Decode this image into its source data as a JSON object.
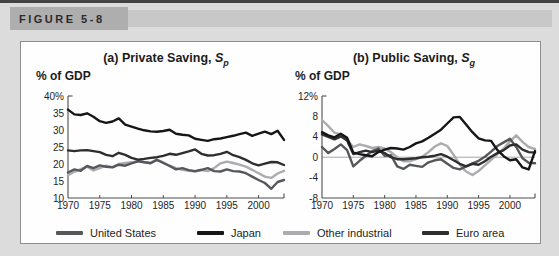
{
  "header": {
    "figure_label": "FIGURE 5-8"
  },
  "legend": {
    "items": [
      {
        "label": "United States",
        "color": "#55575a"
      },
      {
        "label": "Japan",
        "color": "#161616"
      },
      {
        "label": "Other industrial",
        "color": "#aaacaf"
      },
      {
        "label": "Euro area",
        "color": "#2e2e2e"
      }
    ]
  },
  "chart_data": [
    {
      "type": "line",
      "title_main": "(a) Private Saving,",
      "title_symbol": "S",
      "title_subscript": "p",
      "ylabel": "% of GDP",
      "xlim": [
        1970,
        2004
      ],
      "ylim": [
        10,
        40
      ],
      "x_ticks": [
        1970,
        1975,
        1980,
        1985,
        1990,
        1995,
        2000
      ],
      "x_tick_labels": [
        "1970",
        "1975",
        "1980",
        "1985",
        "1990",
        "1995",
        "2000"
      ],
      "y_ticks": [
        10,
        15,
        20,
        25,
        30,
        35,
        40
      ],
      "y_tick_labels": [
        "10",
        "15",
        "20",
        "25",
        "30",
        "35",
        "40%"
      ],
      "zero_line": false,
      "grid": false,
      "x": [
        1970,
        1971,
        1972,
        1973,
        1974,
        1975,
        1976,
        1977,
        1978,
        1979,
        1980,
        1981,
        1982,
        1983,
        1984,
        1985,
        1986,
        1987,
        1988,
        1989,
        1990,
        1991,
        1992,
        1993,
        1994,
        1995,
        1996,
        1997,
        1998,
        1999,
        2000,
        2001,
        2002,
        2003,
        2004
      ],
      "series": [
        {
          "name": "Other industrial",
          "color": "#aaacaf",
          "values": [
            16.7,
            17.7,
            18.5,
            19.2,
            18.1,
            18.8,
            19.5,
            19.1,
            20.0,
            20.3,
            20.5,
            20.9,
            20.6,
            20.4,
            21.3,
            20.5,
            19.5,
            18.8,
            18.3,
            18.0,
            17.8,
            18.2,
            17.9,
            18.8,
            20.2,
            20.7,
            20.3,
            19.8,
            19.2,
            18.3,
            17.3,
            16.3,
            15.9,
            17.2,
            18.0
          ]
        },
        {
          "name": "United States",
          "color": "#55575a",
          "values": [
            17.5,
            18.4,
            18.0,
            19.4,
            18.8,
            19.6,
            19.2,
            19.0,
            19.8,
            19.5,
            20.2,
            20.8,
            20.5,
            20.2,
            21.2,
            20.3,
            19.4,
            18.4,
            18.8,
            18.2,
            17.9,
            18.3,
            18.8,
            17.9,
            17.8,
            18.4,
            17.9,
            17.8,
            17.3,
            16.3,
            15.3,
            14.4,
            12.7,
            14.7,
            15.3
          ]
        },
        {
          "name": "Euro area",
          "color": "#2e2e2e",
          "values": [
            24.0,
            23.8,
            24.0,
            24.1,
            23.8,
            23.5,
            22.7,
            22.3,
            23.3,
            22.7,
            21.8,
            21.3,
            21.5,
            21.8,
            22.0,
            22.4,
            23.0,
            22.7,
            23.2,
            23.7,
            24.3,
            23.0,
            22.5,
            22.6,
            23.0,
            23.6,
            22.6,
            22.0,
            21.2,
            20.2,
            19.6,
            20.1,
            20.6,
            20.5,
            19.7
          ]
        },
        {
          "name": "Japan",
          "color": "#161616",
          "values": [
            36.0,
            34.6,
            34.4,
            34.9,
            33.9,
            32.6,
            32.1,
            32.5,
            33.4,
            31.6,
            31.0,
            30.4,
            29.9,
            29.6,
            29.5,
            29.7,
            30.1,
            28.9,
            28.6,
            28.4,
            27.4,
            27.1,
            26.8,
            27.3,
            27.5,
            27.9,
            28.3,
            28.8,
            29.2,
            28.3,
            28.9,
            29.5,
            28.8,
            29.8,
            27.1
          ]
        }
      ]
    },
    {
      "type": "line",
      "title_main": "(b) Public Saving,",
      "title_symbol": "S",
      "title_subscript": "g",
      "ylabel": "% of GDP",
      "xlim": [
        1970,
        2004
      ],
      "ylim": [
        -8,
        12
      ],
      "x_ticks": [
        1970,
        1975,
        1980,
        1985,
        1990,
        1995,
        2000
      ],
      "x_tick_labels": [
        "1970",
        "1975",
        "1980",
        "1985",
        "1990",
        "1995",
        "2000"
      ],
      "y_ticks": [
        -8,
        -4,
        0,
        4,
        8,
        12
      ],
      "y_tick_labels": [
        "-8",
        "-4",
        "0",
        "4",
        "8",
        "12%"
      ],
      "zero_line": true,
      "grid": false,
      "x": [
        1970,
        1971,
        1972,
        1973,
        1974,
        1975,
        1976,
        1977,
        1978,
        1979,
        1980,
        1981,
        1982,
        1983,
        1984,
        1985,
        1986,
        1987,
        1988,
        1989,
        1990,
        1991,
        1992,
        1993,
        1994,
        1995,
        1996,
        1997,
        1998,
        1999,
        2000,
        2001,
        2002,
        2003,
        2004
      ],
      "series": [
        {
          "name": "Other industrial",
          "color": "#aaacaf",
          "values": [
            7.3,
            6.1,
            4.8,
            4.5,
            3.4,
            2.0,
            2.5,
            2.2,
            1.8,
            2.0,
            1.7,
            1.0,
            0.0,
            -0.8,
            -0.8,
            -0.4,
            0.1,
            1.0,
            2.1,
            2.7,
            2.2,
            0.5,
            -1.5,
            -2.8,
            -3.5,
            -2.7,
            -1.6,
            -0.5,
            0.6,
            1.7,
            3.1,
            4.3,
            3.0,
            2.0,
            1.6
          ]
        },
        {
          "name": "United States",
          "color": "#55575a",
          "values": [
            2.0,
            0.8,
            1.6,
            2.5,
            1.4,
            -1.8,
            -0.7,
            0.3,
            1.2,
            1.7,
            0.3,
            0.4,
            -1.8,
            -2.3,
            -1.5,
            -1.7,
            -1.9,
            -1.0,
            -0.6,
            -0.4,
            -1.3,
            -2.1,
            -2.4,
            -1.8,
            -1.2,
            -0.7,
            0.1,
            1.1,
            2.2,
            2.9,
            3.6,
            2.0,
            -0.2,
            -1.1,
            -1.2
          ]
        },
        {
          "name": "Euro area",
          "color": "#2e2e2e",
          "values": [
            4.5,
            4.0,
            3.5,
            4.1,
            3.3,
            0.6,
            1.0,
            1.3,
            1.0,
            1.3,
            0.8,
            0.0,
            -0.4,
            -0.4,
            -0.3,
            -0.2,
            0.0,
            0.1,
            0.3,
            0.6,
            0.1,
            -0.6,
            -1.3,
            -1.8,
            -1.3,
            -1.5,
            -0.8,
            0.1,
            0.8,
            1.4,
            2.3,
            2.5,
            1.5,
            1.0,
            0.9
          ]
        },
        {
          "name": "Japan",
          "color": "#161616",
          "values": [
            4.9,
            4.3,
            3.9,
            4.6,
            3.8,
            0.9,
            0.6,
            0.4,
            0.2,
            1.0,
            1.5,
            1.8,
            1.7,
            1.5,
            2.0,
            2.7,
            3.1,
            3.8,
            4.6,
            5.4,
            6.6,
            7.8,
            7.9,
            6.4,
            4.9,
            3.7,
            3.3,
            3.2,
            1.4,
            0.2,
            -0.6,
            -0.4,
            -2.0,
            -2.4,
            1.2
          ]
        }
      ]
    }
  ]
}
